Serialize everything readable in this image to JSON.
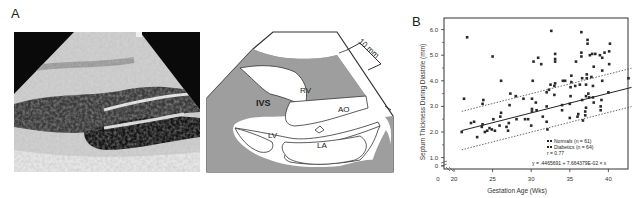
{
  "panels": {
    "a": {
      "label": "A"
    },
    "b": {
      "label": "B"
    }
  },
  "diagram": {
    "labels": {
      "ivs": "IVS",
      "rv": "RV",
      "ao": "AO",
      "lv": "LV",
      "la": "LA",
      "scale": "10 mm"
    }
  },
  "chart_data": {
    "type": "scatter",
    "title": "",
    "xlabel": "Gestation Age (Wks)",
    "ylabel": "Septum Thickness During Diastole (mm)",
    "xlim": [
      20,
      43
    ],
    "ylim": [
      0,
      6.5
    ],
    "x_ticks": [
      "0",
      "20",
      "25",
      "30",
      "35",
      "40"
    ],
    "y_ticks": [
      "0",
      "1.0",
      "2.0",
      "3.0",
      "4.0",
      "5.0",
      "6.0"
    ],
    "axis_break": true,
    "grid": false,
    "legend": {
      "position": "lower right",
      "entries": [
        "Normals (n = 61)",
        "Diabetics (n = 64)"
      ],
      "r": "r = 0.77",
      "equation": "y = .4465691 + 7.664379E-02 × x"
    },
    "regression": {
      "intercept": 0.4465691,
      "slope": 0.07664379,
      "line_style": "solid",
      "confidence_band_style": "dotted",
      "band_offset": 0.75
    },
    "series": [
      {
        "name": "Points",
        "points": [
          [
            21,
            2.0
          ],
          [
            21.3,
            3.3
          ],
          [
            21.7,
            5.7
          ],
          [
            22.2,
            2.35
          ],
          [
            22.6,
            2.4
          ],
          [
            23,
            1.8
          ],
          [
            23.6,
            2.2
          ],
          [
            23.7,
            2.3
          ],
          [
            23.7,
            3.1
          ],
          [
            23.8,
            3.25
          ],
          [
            24,
            2.0
          ],
          [
            24.3,
            2.05
          ],
          [
            24.6,
            2.15
          ],
          [
            24.9,
            2.1
          ],
          [
            25,
            4.95
          ],
          [
            25.1,
            2.5
          ],
          [
            25.3,
            2.05
          ],
          [
            25.9,
            2.25
          ],
          [
            26,
            2.6
          ],
          [
            26.1,
            2.75
          ],
          [
            26.1,
            4.0
          ],
          [
            26.8,
            2.2
          ],
          [
            27,
            2.05
          ],
          [
            27.1,
            2.35
          ],
          [
            27.2,
            3.05
          ],
          [
            27.3,
            3.5
          ],
          [
            28,
            3.4
          ],
          [
            28.1,
            2.5
          ],
          [
            29,
            3.3
          ],
          [
            29.2,
            2.5
          ],
          [
            29.6,
            2.5
          ],
          [
            30,
            2.25
          ],
          [
            30.1,
            2.8
          ],
          [
            30.1,
            2.9
          ],
          [
            30.1,
            3.3
          ],
          [
            30.2,
            4.0
          ],
          [
            30.3,
            4.75
          ],
          [
            30.6,
            3.15
          ],
          [
            30.7,
            2.85
          ],
          [
            30.9,
            4.9
          ],
          [
            31.3,
            4.65
          ],
          [
            31.5,
            2.6
          ],
          [
            32,
            2.4
          ],
          [
            32,
            3.0
          ],
          [
            32,
            3.55
          ],
          [
            32.1,
            2.1
          ],
          [
            32.3,
            3.65
          ],
          [
            32.5,
            3.85
          ],
          [
            32.6,
            5.95
          ],
          [
            33,
            3.45
          ],
          [
            33,
            3.8
          ],
          [
            33.1,
            3.9
          ],
          [
            33.1,
            4.75
          ],
          [
            33.1,
            4.85
          ],
          [
            33.1,
            5.05
          ],
          [
            34,
            2.85
          ],
          [
            34,
            3.05
          ],
          [
            34.1,
            4.0
          ],
          [
            34.4,
            4.0
          ],
          [
            35,
            2.55
          ],
          [
            35,
            3.1
          ],
          [
            35.1,
            3.4
          ],
          [
            35.1,
            3.75
          ],
          [
            35.2,
            3.95
          ],
          [
            35.2,
            4.2
          ],
          [
            35.7,
            3.8
          ],
          [
            35.8,
            4.75
          ],
          [
            36,
            2.6
          ],
          [
            36.1,
            2.7
          ],
          [
            36.3,
            3.85
          ],
          [
            36.5,
            5.9
          ],
          [
            36.5,
            5.1
          ],
          [
            36.5,
            4.95
          ],
          [
            36.6,
            4.1
          ],
          [
            36.6,
            3.25
          ],
          [
            36.7,
            2.45
          ],
          [
            37,
            2.65
          ],
          [
            37,
            2.8
          ],
          [
            37.1,
            2.95
          ],
          [
            37.1,
            3.4
          ],
          [
            37.1,
            3.85
          ],
          [
            37.2,
            4.1
          ],
          [
            37.2,
            4.25
          ],
          [
            37.3,
            5.45
          ],
          [
            37.3,
            5.6
          ],
          [
            37.4,
            3.5
          ],
          [
            37.5,
            3.35
          ],
          [
            37.6,
            5.0
          ],
          [
            37.8,
            4.15
          ],
          [
            37.9,
            5.05
          ],
          [
            38,
            3.35
          ],
          [
            38,
            3.8
          ],
          [
            38.1,
            3.15
          ],
          [
            38.1,
            4.55
          ],
          [
            38.3,
            5.05
          ],
          [
            38.9,
            5.0
          ],
          [
            39,
            2.85
          ],
          [
            39,
            3.0
          ],
          [
            39.1,
            3.25
          ],
          [
            39.2,
            4.0
          ],
          [
            39.2,
            4.4
          ],
          [
            39.2,
            4.9
          ],
          [
            39.5,
            5.1
          ],
          [
            40,
            3.55
          ],
          [
            40.1,
            4.65
          ],
          [
            40.1,
            5.15
          ],
          [
            40.2,
            5.45
          ],
          [
            42.6,
            4.1
          ]
        ]
      }
    ]
  }
}
